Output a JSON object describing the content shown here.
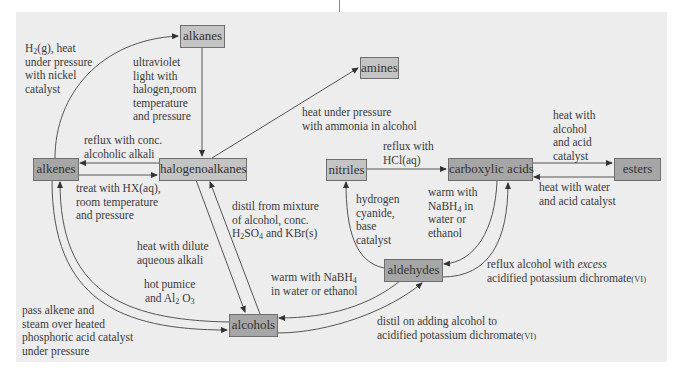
{
  "diagram": {
    "type": "organic-chemistry-reaction-map",
    "colors": {
      "panel_bg": "#ededed",
      "box_dark": "#a6a6a6",
      "box_light": "#c4c4c4",
      "line": "#555555"
    },
    "nodes": {
      "alkanes": "alkanes",
      "amines": "amines",
      "alkenes": "alkenes",
      "halogenoalkanes": "halogenoalkanes",
      "nitriles": "nitriles",
      "carboxylic_acids": "carboxylic acids",
      "esters": "esters",
      "aldehydes": "aldehydes",
      "alcohols": "alcohols"
    },
    "edges": [
      {
        "from": "alkenes",
        "to": "alkanes",
        "label": "H2(g), heat under pressure with nickel catalyst"
      },
      {
        "from": "alkanes",
        "to": "halogenoalkanes",
        "label": "ultraviolet light with halogen,room temperature and pressure"
      },
      {
        "from": "halogenoalkanes",
        "to": "amines",
        "label": "heat under pressure with ammonia in alcohol"
      },
      {
        "from": "halogenoalkanes",
        "to": "alkenes",
        "label": "reflux with conc. alcoholic alkali"
      },
      {
        "from": "alkenes",
        "to": "halogenoalkanes",
        "label": "treat with HX(aq), room temperature and pressure"
      },
      {
        "from": "alcohols",
        "to": "halogenoalkanes",
        "label": "distil from mixture of alcohol, conc. H2SO4 and KBr(s)"
      },
      {
        "from": "halogenoalkanes",
        "to": "alcohols",
        "label": "heat with dilute aqueous alkali"
      },
      {
        "from": "alcohols",
        "to": "alkenes",
        "label": "hot pumice and Al2 O3"
      },
      {
        "from": "alkenes",
        "to": "alcohols",
        "label": "pass alkene and steam over heated phosphoric acid catalyst under pressure"
      },
      {
        "from": "nitriles",
        "to": "carboxylic_acids",
        "label": "reflux with HCl(aq)"
      },
      {
        "from": "carboxylic_acids",
        "to": "esters",
        "label": "heat with alcohol and acid catalyst"
      },
      {
        "from": "esters",
        "to": "carboxylic_acids",
        "label": "heat with water and acid catalyst"
      },
      {
        "from": "aldehydes",
        "to": "nitriles",
        "label": "hydrogen cyanide, base catalyst"
      },
      {
        "from": "carboxylic_acids",
        "to": "aldehydes",
        "label": "warm with NaBH4 in water or ethanol"
      },
      {
        "from": "aldehydes",
        "to": "carboxylic_acids",
        "label": "reflux alcohol with excess acidified potassium dichromate(VI)"
      },
      {
        "from": "aldehydes",
        "to": "alcohols",
        "label": "warm with NaBH4 in water or ethanol"
      },
      {
        "from": "alcohols",
        "to": "aldehydes",
        "label": "distil on adding alcohol to acidified potassium dichromate(VI)"
      }
    ]
  },
  "labels": {
    "h2": {
      "a": "H",
      "sub": "2",
      "b": "(g), heat",
      "l2": "under pressure",
      "l3": "with nickel",
      "l4": "catalyst"
    },
    "uv": {
      "l1": "ultraviolet",
      "l2": "light with",
      "l3": "halogen,room",
      "l4": "temperature",
      "l5": "and pressure"
    },
    "ammonia": {
      "l1": "heat under pressure",
      "l2": "with ammonia in alcohol"
    },
    "reflux_alkali": {
      "l1": "reflux with conc.",
      "l2": "alcoholic alkali"
    },
    "hx": {
      "l1": "treat with HX(aq),",
      "l2": "room temperature",
      "l3": "and pressure"
    },
    "distil_kbr": {
      "l1": "distil from mixture",
      "l2": "of alcohol, conc.",
      "a": "H",
      "s1": "2",
      "b": "SO",
      "s2": "4",
      "c": " and KBr(s)"
    },
    "dilute_alkali": {
      "l1": "heat with dilute",
      "l2": "aqueous alkali"
    },
    "pumice": {
      "l1": "hot pumice",
      "a": "and Al",
      "s1": "2",
      "b": " O",
      "s2": "3"
    },
    "steam": {
      "l1": "pass alkene and",
      "l2": "steam over heated",
      "l3": "phosphoric acid catalyst",
      "l4": "under pressure"
    },
    "hcl": {
      "l1": "reflux with",
      "l2": "HCl(aq)"
    },
    "ester_fwd": {
      "l1": "heat with",
      "l2": "alcohol",
      "l3": "and acid",
      "l4": "catalyst"
    },
    "ester_back": {
      "l1": "heat with water",
      "l2": "and acid catalyst"
    },
    "hcn": {
      "l1": "hydrogen",
      "l2": "cyanide,",
      "l3": "base",
      "l4": "catalyst"
    },
    "nabh4_acid": {
      "l1": "warm with",
      "a": "NaBH",
      "s": "4",
      "b": " in",
      "l3": "water or",
      "l4": "ethanol"
    },
    "excess": {
      "a": "reflux alcohol with ",
      "em": "excess",
      "l2": "acidified potassium dichromate",
      "sc": "(VI)"
    },
    "nabh4_ald": {
      "a": "warm with NaBH",
      "s": "4",
      "l2": "in water or ethanol"
    },
    "distil_ald": {
      "l1": "distil on adding alcohol to",
      "l2": "acidified potassium dichromate",
      "sc": "(VI)"
    }
  }
}
